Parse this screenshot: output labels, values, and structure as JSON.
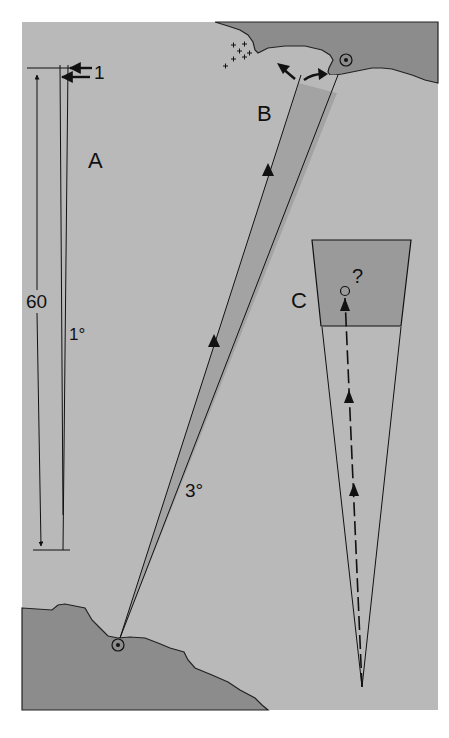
{
  "colors": {
    "page_bg": "#ffffff",
    "sea": "#b9b9b9",
    "land": "#8c8c8c",
    "wedge_fill": "#9e9e9e",
    "target_box_fill": "#9a9a9a",
    "ink": "#111111"
  },
  "panel_a": {
    "label": "A",
    "offset_label": "1",
    "distance_label": "60",
    "angle_label": "1°"
  },
  "panel_b": {
    "label": "B",
    "angle_label": "3°",
    "origin_icon": "target-circle-dot",
    "destination_icon": "target-circle-dot",
    "correction_arrows": [
      "arrow-up-left",
      "arrow-right"
    ],
    "scatter_marks": "plus-cluster"
  },
  "panel_c": {
    "label": "C",
    "target_label": "?",
    "target_icon": "open-circle"
  }
}
